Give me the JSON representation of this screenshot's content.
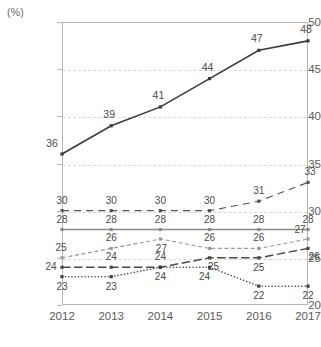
{
  "chart_data": {
    "type": "line",
    "title": "",
    "subtitle": "",
    "xlabel": "",
    "ylabel": "",
    "unit_label": "(%)",
    "categories": [
      "2012",
      "2013",
      "2014",
      "2015",
      "2016",
      "2017"
    ],
    "ylim": [
      20,
      50
    ],
    "yticks": [
      20,
      25,
      30,
      35,
      40,
      45,
      50
    ],
    "ytick_labels": [
      "20",
      "25",
      "30",
      "35",
      "40",
      "45",
      "50"
    ],
    "grid": true,
    "grid_style": "horizontal-dashed",
    "legend": "none",
    "series": [
      {
        "name": "series-a",
        "values": [
          36,
          39,
          41,
          44,
          47,
          48
        ],
        "style": "solid",
        "color": "#3b3b38",
        "width": 1.6,
        "marker": "square",
        "label_offsets": [
          [
            -10,
            -11
          ],
          [
            -2,
            -12
          ],
          [
            -2,
            -12
          ],
          [
            -2,
            -12
          ],
          [
            -2,
            -12
          ],
          [
            -2,
            -12
          ]
        ]
      },
      {
        "name": "series-b",
        "values": [
          30,
          30,
          30,
          30,
          31,
          33
        ],
        "style": "dashdot",
        "color": "#55554f",
        "width": 1.1,
        "marker": "square",
        "label_offsets": [
          [
            0,
            -10
          ],
          [
            0,
            -10
          ],
          [
            0,
            -10
          ],
          [
            0,
            -10
          ],
          [
            0,
            -10
          ],
          [
            2,
            -10
          ]
        ]
      },
      {
        "name": "series-c",
        "values": [
          28,
          28,
          28,
          28,
          28,
          28
        ],
        "style": "solid",
        "color": "#8d8d86",
        "width": 1.5,
        "marker": "square",
        "label_offsets": [
          [
            0,
            -10
          ],
          [
            0,
            -10
          ],
          [
            0,
            -10
          ],
          [
            0,
            -10
          ],
          [
            0,
            -10
          ],
          [
            0,
            -10
          ]
        ]
      },
      {
        "name": "series-d",
        "values": [
          25,
          26,
          27,
          26,
          26,
          27
        ],
        "style": "dashed",
        "color": "#9a9a92",
        "width": 1.1,
        "marker": "square",
        "label_offsets": [
          [
            -1,
            -10
          ],
          [
            0,
            -10
          ],
          [
            1,
            10
          ],
          [
            0,
            -10
          ],
          [
            0,
            -10
          ],
          [
            -8,
            -9
          ]
        ]
      },
      {
        "name": "series-e",
        "values": [
          24,
          24,
          24,
          25,
          25,
          26
        ],
        "style": "longdash",
        "color": "#4a4a45",
        "width": 1.5,
        "marker": "square",
        "label_offsets": [
          [
            -11,
            0
          ],
          [
            0,
            -10
          ],
          [
            0,
            -10
          ],
          [
            4,
            9
          ],
          [
            0,
            10
          ],
          [
            6,
            9
          ]
        ]
      },
      {
        "name": "series-f",
        "values": [
          23,
          23,
          24,
          24,
          22,
          22
        ],
        "style": "dotted",
        "color": "#3f3f3b",
        "width": 1.5,
        "marker": "square",
        "label_offsets": [
          [
            0,
            10
          ],
          [
            0,
            10
          ],
          [
            0,
            10
          ],
          [
            -5,
            10
          ],
          [
            0,
            10
          ],
          [
            0,
            10
          ]
        ]
      }
    ]
  }
}
